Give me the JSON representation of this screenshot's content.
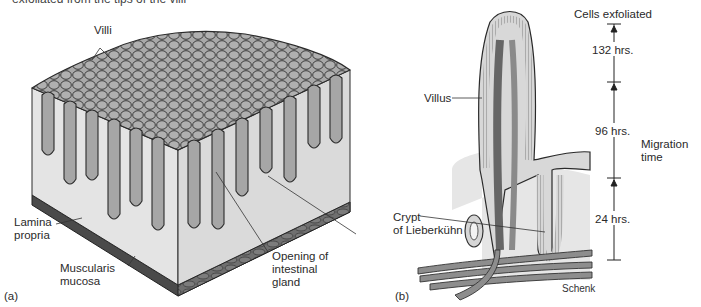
{
  "caption_fragment": "exfoliated from the tips of the villi",
  "panel_a": {
    "panel_label": "(a)",
    "labels": {
      "villi": "Villi",
      "lamina_propria": "Lamina\npropria",
      "muscularis_mucosa": "Muscularis\nmucosa",
      "opening_gland": "Opening of\nintestinal\ngland"
    }
  },
  "panel_b": {
    "panel_label": "(b)",
    "labels": {
      "villus": "Villus",
      "crypt": "Crypt\nof Lieberkühn",
      "artist": "Schenk"
    },
    "timeline": {
      "top_label": "Cells exfoliated",
      "segments": [
        "132 hrs.",
        "96 hrs.",
        "24 hrs."
      ],
      "axis_label": "Migration\ntime"
    }
  },
  "colors": {
    "villus_fill": "#a8a8a8",
    "tissue_light": "#e3e3e3",
    "tissue_mid": "#c4c4c4",
    "outline": "#2b2b2b",
    "muscle_dark": "#6d6d6d"
  }
}
